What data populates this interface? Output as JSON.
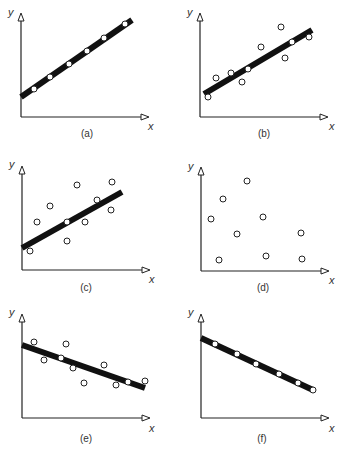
{
  "figure": {
    "axis_x_label": "x",
    "axis_y_label": "y",
    "colors": {
      "line": "#111111",
      "axis": "#222222",
      "point_fill": "#ffffff",
      "point_stroke": "#222222"
    }
  },
  "chart_data": [
    {
      "id": "a",
      "type": "scatter",
      "caption": "(a)",
      "xlabel": "x",
      "ylabel": "y",
      "xlim": [
        0,
        120
      ],
      "ylim": [
        0,
        103
      ],
      "grid": false,
      "description": "Perfect positive linear relationship",
      "points": [
        [
          13,
          28
        ],
        [
          29,
          40
        ],
        [
          48,
          53
        ],
        [
          66,
          66
        ],
        [
          83,
          79
        ],
        [
          104,
          93
        ]
      ],
      "fit_line": [
        [
          0,
          20
        ],
        [
          111,
          97
        ]
      ]
    },
    {
      "id": "b",
      "type": "scatter",
      "caption": "(b)",
      "xlabel": "x",
      "ylabel": "y",
      "xlim": [
        0,
        120
      ],
      "ylim": [
        0,
        103
      ],
      "grid": false,
      "description": "Strong positive linear relationship",
      "points": [
        [
          8,
          20
        ],
        [
          16,
          39
        ],
        [
          31,
          44
        ],
        [
          42,
          35
        ],
        [
          48,
          48
        ],
        [
          61,
          70
        ],
        [
          81,
          90
        ],
        [
          85,
          59
        ],
        [
          92,
          75
        ],
        [
          109,
          80
        ]
      ],
      "fit_line": [
        [
          4,
          23
        ],
        [
          112,
          87
        ]
      ]
    },
    {
      "id": "c",
      "type": "scatter",
      "caption": "(c)",
      "xlabel": "x",
      "ylabel": "y",
      "xlim": [
        0,
        120
      ],
      "ylim": [
        0,
        103
      ],
      "grid": false,
      "description": "Weak positive linear relationship",
      "points": [
        [
          8,
          19
        ],
        [
          15,
          48
        ],
        [
          28,
          64
        ],
        [
          45,
          48
        ],
        [
          45,
          29
        ],
        [
          55,
          85
        ],
        [
          63,
          48
        ],
        [
          75,
          70
        ],
        [
          89,
          60
        ],
        [
          90,
          88
        ]
      ],
      "fit_line": [
        [
          0,
          22
        ],
        [
          100,
          78
        ]
      ]
    },
    {
      "id": "d",
      "type": "scatter",
      "caption": "(d)",
      "xlabel": "x",
      "ylabel": "y",
      "xlim": [
        0,
        120
      ],
      "ylim": [
        0,
        103
      ],
      "grid": false,
      "description": "No relationship",
      "points": [
        [
          18,
          11
        ],
        [
          10,
          52
        ],
        [
          22,
          72
        ],
        [
          36,
          37
        ],
        [
          46,
          90
        ],
        [
          62,
          54
        ],
        [
          65,
          15
        ],
        [
          100,
          38
        ],
        [
          101,
          12
        ]
      ],
      "fit_line": null
    },
    {
      "id": "e",
      "type": "scatter",
      "caption": "(e)",
      "xlabel": "x",
      "ylabel": "y",
      "xlim": [
        0,
        120
      ],
      "ylim": [
        0,
        103
      ],
      "grid": false,
      "description": "Moderate negative linear relationship",
      "points": [
        [
          12,
          76
        ],
        [
          22,
          58
        ],
        [
          44,
          74
        ],
        [
          39,
          60
        ],
        [
          51,
          50
        ],
        [
          62,
          35
        ],
        [
          82,
          53
        ],
        [
          94,
          33
        ],
        [
          106,
          36
        ],
        [
          123,
          37
        ]
      ],
      "fit_line": [
        [
          0,
          73
        ],
        [
          123,
          30
        ]
      ]
    },
    {
      "id": "f",
      "type": "scatter",
      "caption": "(f)",
      "xlabel": "x",
      "ylabel": "y",
      "xlim": [
        0,
        120
      ],
      "ylim": [
        0,
        103
      ],
      "grid": false,
      "description": "Perfect negative linear relationship",
      "points": [
        [
          14,
          74
        ],
        [
          36,
          64
        ],
        [
          55,
          54
        ],
        [
          78,
          44
        ],
        [
          97,
          35
        ],
        [
          112,
          28
        ]
      ],
      "fit_line": [
        [
          0,
          80
        ],
        [
          112,
          28
        ]
      ]
    }
  ]
}
